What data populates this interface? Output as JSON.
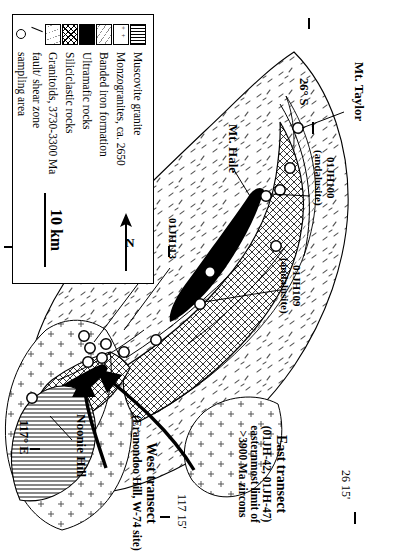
{
  "figure": {
    "type": "geological-map",
    "region": "Jack Hills, Narryer Terrane, Western Australia"
  },
  "legend": {
    "title": "",
    "items": [
      {
        "label": "Muscovite granite",
        "swatch": "vertical-lines-pattern"
      },
      {
        "label": "Monzogranites, ca. 2650",
        "swatch": "cross-plus-pattern"
      },
      {
        "label": "Banded iron formation",
        "swatch": "fine-dash-pattern"
      },
      {
        "label": "Ultramafic rocks",
        "swatch": "solid-black"
      },
      {
        "label": "Siliciclastic rocks",
        "swatch": "cross-hatch-pattern"
      },
      {
        "label": "Granitoids, 3730-3300 Ma",
        "swatch": "sparse-dash-pattern"
      },
      {
        "label": "fault/ shear zone",
        "swatch": "line-symbol"
      },
      {
        "label": "sampling area",
        "swatch": "circle-symbol"
      }
    ]
  },
  "scale": {
    "length_label": "10 km"
  },
  "north_arrow": {
    "label": "N"
  },
  "place_labels": [
    {
      "name": "Mt. Taylor"
    },
    {
      "name": "Mt. Hale"
    },
    {
      "name": "Noonie Hill"
    }
  ],
  "sample_labels": [
    {
      "id": "01JH100",
      "note": "(andalusite)"
    },
    {
      "id": "01JH109",
      "note": "(andalusite)"
    },
    {
      "id": "01JH113",
      "note": ""
    },
    {
      "id": "01JH36",
      "note": ""
    },
    {
      "id": "01JH32, 33",
      "note": "(andalusite)"
    }
  ],
  "transects": {
    "east": {
      "title": "East transect",
      "samples": "(01JH-42, 01JH-47)",
      "line2": "easternmost limit of",
      "line3": ">3900 Ma zircons"
    },
    "west": {
      "title": "West transect",
      "site": "(Eranondoo Hill, W-74 site)"
    }
  },
  "graticule": [
    {
      "label": "26° S"
    },
    {
      "label": "26 15'"
    },
    {
      "label": "117° E"
    },
    {
      "label": "117 15'"
    }
  ]
}
